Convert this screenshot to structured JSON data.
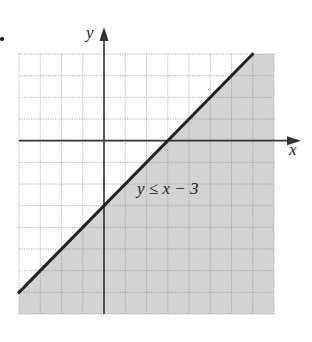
{
  "figure": {
    "marker": ".",
    "inequality_label": "y ≤ x − 3",
    "x_axis_label": "x",
    "y_axis_label": "y"
  },
  "colors": {
    "shade": "#d3d3d3",
    "grid": "#9a9a9a",
    "axis": "#333333",
    "boundary": "#222222"
  },
  "chart_data": {
    "type": "area",
    "title": "",
    "annotation": "y ≤ x − 3",
    "xlabel": "x",
    "ylabel": "y",
    "xlim": [
      -4,
      8
    ],
    "ylim": [
      -8,
      4
    ],
    "grid": true,
    "grid_step": 1,
    "boundary_line": {
      "equation": "y = x - 3",
      "slope": 1,
      "intercept": -3,
      "style": "solid"
    },
    "shaded_region": "below line (y <= x - 3)",
    "series": [
      {
        "name": "y = x - 3",
        "x": [
          -4,
          7
        ],
        "y": [
          -7,
          4
        ]
      }
    ]
  }
}
